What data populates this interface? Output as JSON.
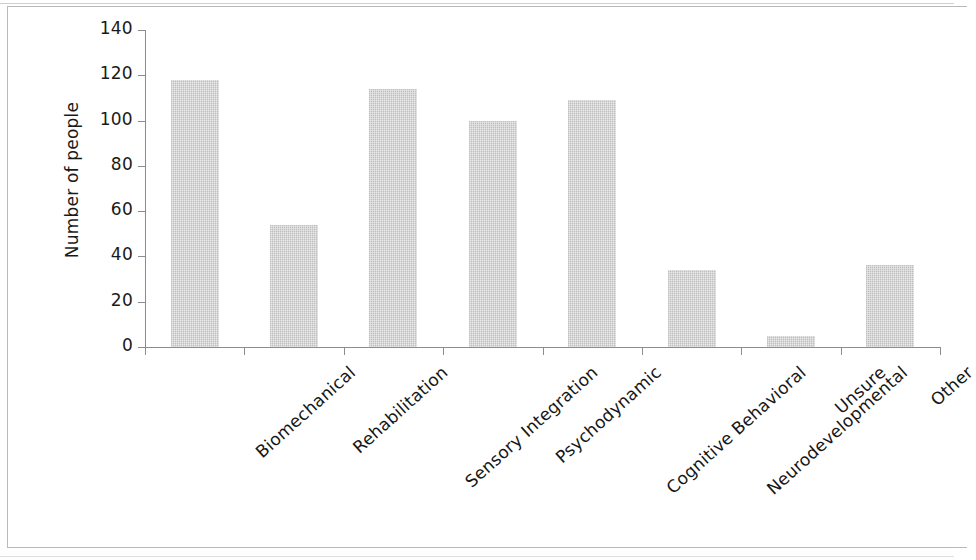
{
  "chart_data": {
    "type": "bar",
    "title": "",
    "xlabel": "",
    "ylabel": "Number of people",
    "categories": [
      "Biomechanical",
      "Rehabilitation",
      "Sensory Integration",
      "Psychodynamic",
      "Cognitive Behavioral",
      "Neurodevelopmental",
      "Unsure",
      "Other"
    ],
    "values": [
      118,
      54,
      114,
      100,
      109,
      34,
      5,
      36
    ],
    "ylim": [
      0,
      140
    ],
    "ytick_labels": [
      "140",
      "120",
      "100",
      "80",
      "60",
      "40",
      "20",
      "0"
    ],
    "ytick_values": [
      140,
      120,
      100,
      80,
      60,
      40,
      20,
      0
    ],
    "grid": false,
    "legend": false,
    "legend_position": "none",
    "bar_color": "#c9c9c9",
    "axis_color": "#8c8c8c",
    "text_color": "#161616",
    "background": "#ffffff",
    "xtick_label_rotation": -42
  }
}
